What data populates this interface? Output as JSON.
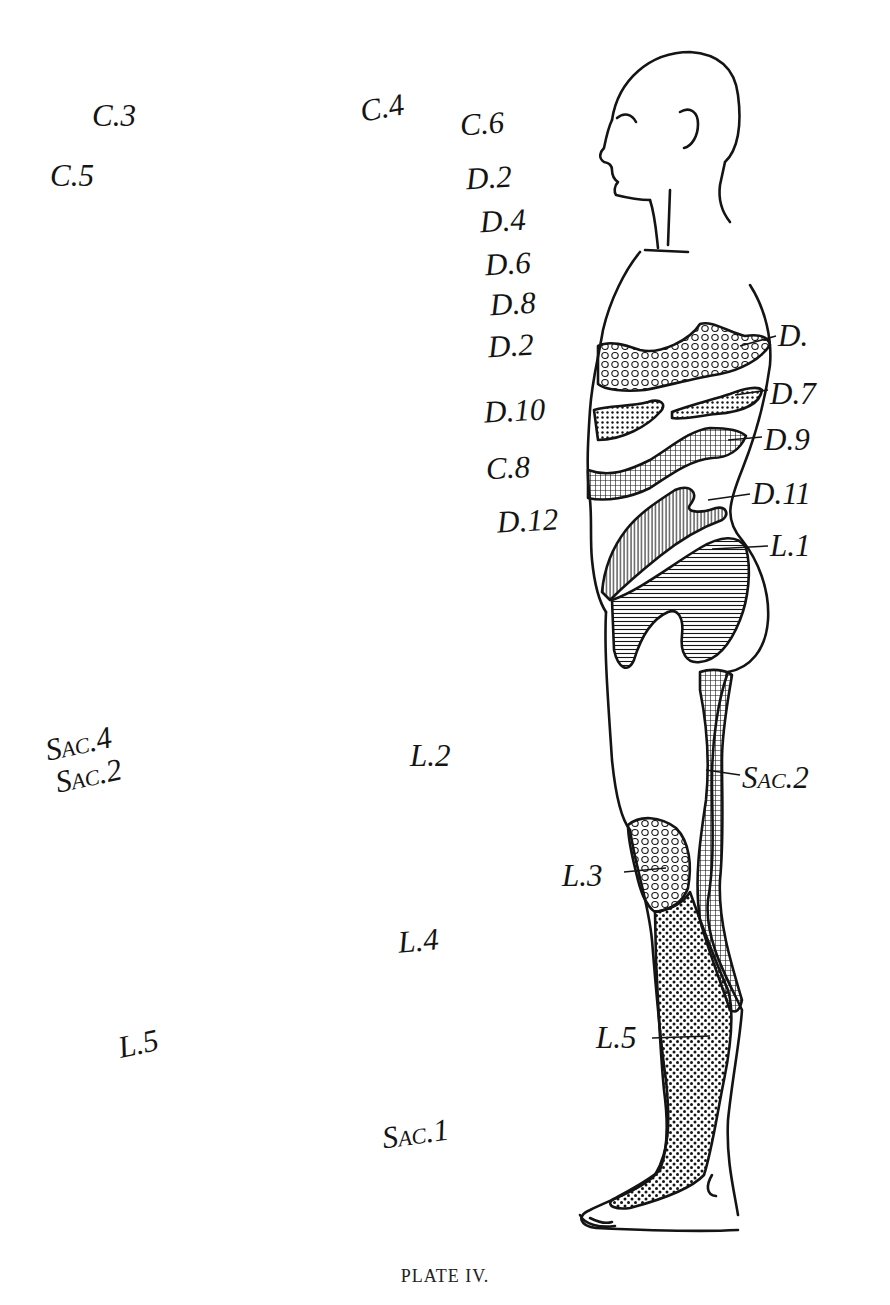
{
  "plate": {
    "caption": "PLATE IV.",
    "subject": "Lateral view of standing figure showing segmental sensory areas"
  },
  "stray_labels": [
    {
      "id": "c3",
      "text": "C.3",
      "x": 92,
      "y": 100,
      "rot": 0
    },
    {
      "id": "c5",
      "text": "C.5",
      "x": 50,
      "y": 160,
      "rot": 0
    },
    {
      "id": "c4",
      "text": "C.4",
      "x": 360,
      "y": 92,
      "rot": -10
    },
    {
      "id": "c6",
      "text": "C.6",
      "x": 460,
      "y": 108,
      "rot": -4
    },
    {
      "id": "d2a",
      "text": "D.2",
      "x": 466,
      "y": 162,
      "rot": -3
    },
    {
      "id": "d4",
      "text": "D.4",
      "x": 480,
      "y": 205,
      "rot": -3
    },
    {
      "id": "d6",
      "text": "D.6",
      "x": 485,
      "y": 248,
      "rot": -3
    },
    {
      "id": "d8",
      "text": "D.8",
      "x": 490,
      "y": 288,
      "rot": -3
    },
    {
      "id": "d2b",
      "text": "D.2",
      "x": 488,
      "y": 330,
      "rot": -3
    },
    {
      "id": "d10",
      "text": "D.10",
      "x": 484,
      "y": 395,
      "rot": -3
    },
    {
      "id": "c8",
      "text": "C.8",
      "x": 486,
      "y": 452,
      "rot": -3
    },
    {
      "id": "d12",
      "text": "D.12",
      "x": 497,
      "y": 505,
      "rot": -3
    },
    {
      "id": "sac4",
      "text": "Sac.4",
      "x": 45,
      "y": 728,
      "rot": -12
    },
    {
      "id": "sac2l",
      "text": "Sac.2",
      "x": 55,
      "y": 760,
      "rot": -12
    },
    {
      "id": "l2",
      "text": "L.2",
      "x": 410,
      "y": 740,
      "rot": 0
    },
    {
      "id": "l4",
      "text": "L.4",
      "x": 398,
      "y": 925,
      "rot": -5
    },
    {
      "id": "l5l",
      "text": "L.5",
      "x": 118,
      "y": 1028,
      "rot": -12
    },
    {
      "id": "sac1",
      "text": "Sac.1",
      "x": 382,
      "y": 1118,
      "rot": -8
    }
  ],
  "leader_labels": [
    {
      "id": "d",
      "text": "D.",
      "x": 778,
      "y": 320,
      "line": [
        740,
        346,
        776,
        336
      ]
    },
    {
      "id": "d7",
      "text": "D.7",
      "x": 770,
      "y": 378,
      "line": [
        735,
        395,
        768,
        390
      ]
    },
    {
      "id": "d9",
      "text": "D.9",
      "x": 764,
      "y": 424,
      "line": [
        728,
        440,
        762,
        437
      ]
    },
    {
      "id": "d11",
      "text": "D.11",
      "x": 752,
      "y": 478,
      "line": [
        708,
        500,
        750,
        494
      ]
    },
    {
      "id": "l1",
      "text": "L.1",
      "x": 770,
      "y": 530,
      "line": [
        712,
        549,
        768,
        546
      ]
    },
    {
      "id": "sac2",
      "text": "Sac.2",
      "x": 742,
      "y": 762,
      "line": [
        706,
        770,
        740,
        775
      ]
    },
    {
      "id": "l3",
      "text": "L.3",
      "x": 562,
      "y": 860,
      "line": [
        624,
        872,
        666,
        868
      ]
    },
    {
      "id": "l5",
      "text": "L.5",
      "x": 596,
      "y": 1022,
      "line": [
        652,
        1038,
        710,
        1036
      ]
    }
  ],
  "zones": [
    {
      "name": "D. (upper chest band)",
      "pattern": "circles"
    },
    {
      "name": "D.7",
      "pattern": "fine-dots"
    },
    {
      "name": "D.9",
      "pattern": "crosshatch"
    },
    {
      "name": "D.11",
      "pattern": "vertical-lines"
    },
    {
      "name": "L.1",
      "pattern": "horizontal-lines"
    },
    {
      "name": "Sac.2",
      "pattern": "crosshatch"
    },
    {
      "name": "L.3",
      "pattern": "circles"
    },
    {
      "name": "L.5",
      "pattern": "coarse-dots"
    }
  ],
  "colors": {
    "ink": "#141414",
    "paper": "#ffffff"
  }
}
